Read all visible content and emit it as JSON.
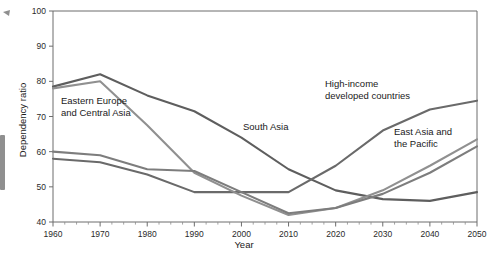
{
  "chart_data": {
    "type": "line",
    "title": "",
    "xlabel": "Year",
    "ylabel": "Dependency ratio",
    "xlim": [
      1960,
      2050
    ],
    "ylim": [
      40,
      100
    ],
    "grid": false,
    "legend_position": "inline-annotations",
    "x_ticks": [
      1960,
      1970,
      1980,
      1990,
      2000,
      2010,
      2020,
      2030,
      2040,
      2050
    ],
    "x_tick_labels": [
      "1960",
      "1970",
      "1980",
      "1990",
      "2000",
      "2010",
      "2020",
      "2030",
      "2040",
      "2050"
    ],
    "x_minor_tick_step": 2.5,
    "y_ticks": [
      40,
      50,
      60,
      70,
      80,
      90,
      100
    ],
    "y_tick_labels": [
      "40",
      "50",
      "60",
      "70",
      "80",
      "90",
      "100"
    ],
    "x": [
      1960,
      1970,
      1980,
      1990,
      2000,
      2010,
      2020,
      2030,
      2040,
      2050
    ],
    "series": [
      {
        "name": "South Asia",
        "color": "#5e5e5e",
        "label": "South Asia",
        "label_x": 243,
        "label_y": 130,
        "values": [
          78.5,
          82.0,
          76.0,
          71.5,
          64.0,
          55.0,
          49.0,
          46.5,
          46.0,
          48.5
        ]
      },
      {
        "name": "High-income developed countries",
        "color": "#6a6a6a",
        "label": "High-income\ndeveloped countries",
        "label_x": 325,
        "label_y": 87,
        "values": [
          58.0,
          57.0,
          53.5,
          48.5,
          48.5,
          48.5,
          56.0,
          66.0,
          72.0,
          74.5
        ]
      },
      {
        "name": "East Asia and the Pacific",
        "color": "#909090",
        "label": "East Asia and\nthe Pacific",
        "label_x": 394,
        "label_y": 135,
        "values": [
          78.0,
          80.0,
          67.5,
          54.0,
          47.5,
          42.0,
          44.0,
          49.0,
          56.0,
          63.5
        ]
      },
      {
        "name": "Eastern Europe and Central Asia",
        "color": "#7d7d7d",
        "label": "Eastern Europe\nand Central Asia",
        "label_x": 61,
        "label_y": 104,
        "values": [
          60.0,
          59.0,
          55.0,
          54.5,
          48.5,
          42.5,
          44.0,
          48.0,
          54.0,
          61.5
        ]
      }
    ]
  },
  "annotations": {
    "south_asia": "South Asia",
    "high_income_line1": "High-income",
    "high_income_line2": "developed countries",
    "east_asia_line1": "East Asia and",
    "east_asia_line2": "the Pacific",
    "eastern_europe_line1": "Eastern Europe",
    "eastern_europe_line2": "and Central Asia"
  }
}
